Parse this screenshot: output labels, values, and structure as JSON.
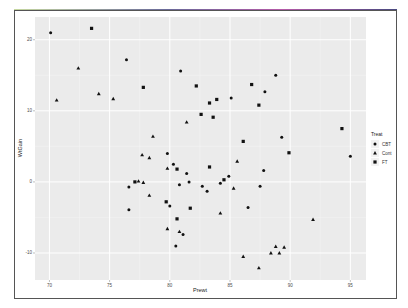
{
  "chart_data": {
    "type": "scatter",
    "title": "",
    "xlabel": "Prewt",
    "ylabel": "WtGain",
    "xlim": [
      68.8,
      96.3
    ],
    "ylim": [
      -13.8,
      23.2
    ],
    "xticks": [
      70,
      75,
      80,
      85,
      90,
      95
    ],
    "yticks": [
      -10,
      0,
      10,
      20
    ],
    "xtick_labels": [
      "70",
      "75",
      "80",
      "85",
      "90",
      "95"
    ],
    "ytick_labels": [
      "-10",
      "0",
      "10",
      "20"
    ],
    "grid": true,
    "background": "#ebebeb",
    "legend": {
      "title": "Treat",
      "position": "right",
      "entries": [
        {
          "label": "CBT",
          "shape": "circle"
        },
        {
          "label": "Cont",
          "shape": "triangle"
        },
        {
          "label": "FT",
          "shape": "square"
        }
      ]
    },
    "series": [
      {
        "name": "CBT",
        "shape": "circle",
        "points": [
          [
            70.1,
            21.0
          ],
          [
            76.4,
            17.2
          ],
          [
            80.9,
            15.6
          ],
          [
            85.1,
            11.8
          ],
          [
            87.9,
            12.7
          ],
          [
            88.8,
            15.0
          ],
          [
            89.3,
            6.3
          ],
          [
            95.0,
            3.6
          ],
          [
            79.8,
            4.0
          ],
          [
            80.3,
            2.5
          ],
          [
            81.4,
            1.2
          ],
          [
            84.9,
            0.8
          ],
          [
            87.8,
            1.6
          ],
          [
            76.6,
            -0.7
          ],
          [
            80.8,
            -0.4
          ],
          [
            81.6,
            0.0
          ],
          [
            82.7,
            -0.6
          ],
          [
            83.1,
            -1.3
          ],
          [
            84.2,
            -0.2
          ],
          [
            87.5,
            -0.6
          ],
          [
            76.6,
            -3.9
          ],
          [
            80.0,
            -3.4
          ],
          [
            86.5,
            -3.6
          ],
          [
            81.1,
            -7.4
          ],
          [
            80.5,
            -9.0
          ]
        ]
      },
      {
        "name": "Cont",
        "shape": "triangle",
        "points": [
          [
            72.4,
            16.0
          ],
          [
            70.6,
            11.5
          ],
          [
            74.1,
            12.4
          ],
          [
            75.3,
            11.7
          ],
          [
            81.4,
            8.4
          ],
          [
            78.6,
            6.4
          ],
          [
            77.7,
            3.8
          ],
          [
            78.3,
            3.4
          ],
          [
            79.8,
            1.9
          ],
          [
            85.6,
            2.9
          ],
          [
            77.4,
            0.1
          ],
          [
            77.8,
            -0.1
          ],
          [
            78.3,
            -1.9
          ],
          [
            85.3,
            -0.9
          ],
          [
            84.2,
            -4.4
          ],
          [
            91.9,
            -5.3
          ],
          [
            79.8,
            -6.6
          ],
          [
            80.8,
            -7.0
          ],
          [
            86.1,
            -10.5
          ],
          [
            87.4,
            -12.1
          ],
          [
            88.4,
            -10.0
          ],
          [
            88.8,
            -9.1
          ],
          [
            89.1,
            -10.0
          ],
          [
            89.5,
            -9.2
          ]
        ]
      },
      {
        "name": "FT",
        "shape": "square",
        "points": [
          [
            73.5,
            21.6
          ],
          [
            77.8,
            13.3
          ],
          [
            82.2,
            13.5
          ],
          [
            82.6,
            9.5
          ],
          [
            83.3,
            11.1
          ],
          [
            83.9,
            11.6
          ],
          [
            83.6,
            9.1
          ],
          [
            86.8,
            13.7
          ],
          [
            87.4,
            10.8
          ],
          [
            86.1,
            5.7
          ],
          [
            89.9,
            4.1
          ],
          [
            94.3,
            7.5
          ],
          [
            80.6,
            1.8
          ],
          [
            83.3,
            2.1
          ],
          [
            84.5,
            0.3
          ],
          [
            77.1,
            0.0
          ],
          [
            79.7,
            -2.8
          ],
          [
            81.7,
            -3.7
          ],
          [
            80.6,
            -5.2
          ]
        ]
      }
    ]
  }
}
